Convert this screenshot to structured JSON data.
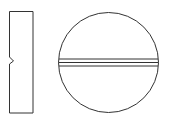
{
  "diagram": {
    "views": [
      {
        "name": "side-view",
        "shape": "rectangle-with-notch",
        "x": 9.5,
        "y": 11.5,
        "width": 23.5,
        "height": 101.5,
        "notch": {
          "y_top": 57,
          "y_mid": 61,
          "y_bottom": 64,
          "depth_x": 13.5
        }
      },
      {
        "name": "top-view",
        "shape": "circle-with-score-lines",
        "cx": 108.5,
        "cy": 62.5,
        "r": 50,
        "score_lines_y": [
          59,
          62.5,
          66
        ]
      }
    ],
    "stroke_color": "#333333",
    "background": "#ffffff"
  }
}
